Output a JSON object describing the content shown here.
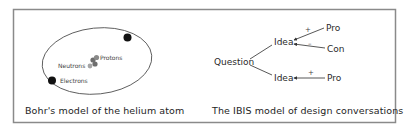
{
  "figure": {
    "frame_color": "#8a8a8a",
    "ink_color": "#222222"
  },
  "bohr": {
    "caption": "Bohr's model of the helium atom",
    "labels": {
      "protons": "Protons",
      "neutrons": "Neutrons",
      "electrons": "Electrons"
    },
    "colors": {
      "electron": "#111111",
      "proton": "#6e6e6e",
      "neutron": "#9a9a9a",
      "orbit": "#555555"
    }
  },
  "ibis": {
    "caption": "The IBIS model of design conversations",
    "nodes": {
      "question": "Question",
      "idea_top": "Idea",
      "idea_bottom": "Idea",
      "pro_top": "Pro",
      "con": "Con",
      "pro_bottom": "Pro"
    },
    "signs": {
      "pro_top": "+",
      "con": "–",
      "pro_bottom": "+"
    }
  }
}
